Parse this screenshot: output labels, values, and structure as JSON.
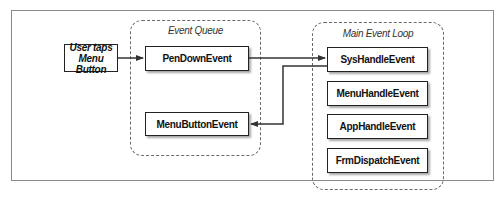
{
  "diagram": {
    "input": {
      "label_line1": "User taps",
      "label_line2": "Menu Button"
    },
    "groups": {
      "event_queue": {
        "title": "Event Queue",
        "nodes": [
          "PenDownEvent",
          "MenuButtonEvent"
        ]
      },
      "main_event_loop": {
        "title": "Main Event Loop",
        "nodes": [
          "SysHandleEvent",
          "MenuHandleEvent",
          "AppHandleEvent",
          "FrmDispatchEvent"
        ]
      }
    },
    "edges": [
      {
        "from": "User taps Menu Button",
        "to": "PenDownEvent"
      },
      {
        "from": "PenDownEvent",
        "to": "SysHandleEvent"
      },
      {
        "from": "SysHandleEvent",
        "to": "MenuButtonEvent"
      }
    ]
  }
}
